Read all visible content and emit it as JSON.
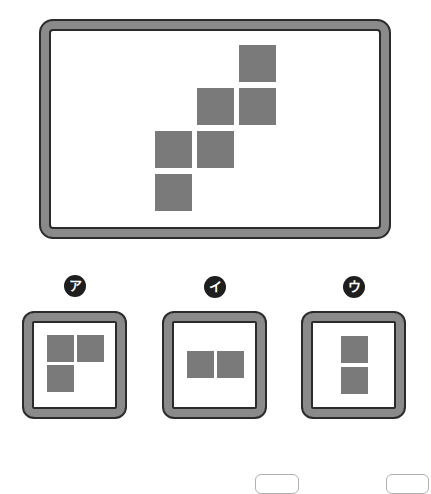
{
  "colors": {
    "square": "#7a7a7a",
    "frame_fill": "#8a8a8a",
    "frame_outline": "#2b2b2b",
    "badge": "#1e1e1e"
  },
  "main_figure": {
    "squares": [
      {
        "x": 239,
        "y": 45
      },
      {
        "x": 197,
        "y": 88
      },
      {
        "x": 239,
        "y": 88
      },
      {
        "x": 155,
        "y": 131
      },
      {
        "x": 197,
        "y": 131
      },
      {
        "x": 155,
        "y": 174
      }
    ],
    "square_size": 37
  },
  "options": [
    {
      "label": "ア",
      "badge": {
        "x": 64,
        "y": 275
      },
      "frame": {
        "x": 22,
        "y": 311
      },
      "squares": [
        {
          "x": 47,
          "y": 335
        },
        {
          "x": 77,
          "y": 335
        },
        {
          "x": 47,
          "y": 365
        }
      ]
    },
    {
      "label": "イ",
      "badge": {
        "x": 204,
        "y": 276
      },
      "frame": {
        "x": 162,
        "y": 311
      },
      "squares": [
        {
          "x": 187,
          "y": 351
        },
        {
          "x": 217,
          "y": 351
        }
      ]
    },
    {
      "label": "ウ",
      "badge": {
        "x": 343,
        "y": 276
      },
      "frame": {
        "x": 301,
        "y": 311
      },
      "squares": [
        {
          "x": 341,
          "y": 336
        },
        {
          "x": 341,
          "y": 367
        }
      ]
    }
  ],
  "option_square_size": 27,
  "partial_boxes": [
    {
      "x": 255,
      "w": 44
    },
    {
      "x": 386,
      "w": 43
    }
  ]
}
